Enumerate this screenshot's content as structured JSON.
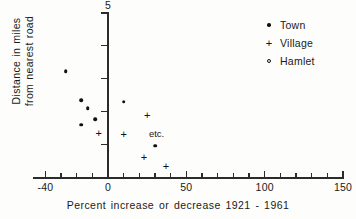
{
  "chart_data": {
    "type": "scatter",
    "title": "",
    "xlabel": "Percent increase or decrease 1921 - 1961",
    "ylabel_lines": [
      "Distance in miles",
      "from nearest road"
    ],
    "xlim": [
      -40,
      150
    ],
    "ylim": [
      0,
      5
    ],
    "xticks": [
      -40,
      0,
      50,
      100,
      150
    ],
    "xticklabels": [
      "-40",
      "0",
      "50",
      "100",
      "150"
    ],
    "x_minor_tick_step": 10,
    "yticks": [
      0,
      1,
      2,
      3,
      4,
      5
    ],
    "yticklabels_visible": [
      "5"
    ],
    "grid": false,
    "legend_position": "upper right",
    "series": [
      {
        "name": "Town",
        "marker": "filled-circle",
        "color": "#111111",
        "points": [
          {
            "x": -27,
            "y": 3.22
          },
          {
            "x": -17,
            "y": 2.35
          },
          {
            "x": -13,
            "y": 2.1
          },
          {
            "x": -17,
            "y": 1.59
          },
          {
            "x": -8,
            "y": 1.77
          },
          {
            "x": 10,
            "y": 2.29
          },
          {
            "x": 30,
            "y": 0.95
          }
        ]
      },
      {
        "name": "Village",
        "marker": "plus",
        "color": "#111111",
        "points": [
          {
            "x": -6,
            "y": 1.34
          },
          {
            "x": 10,
            "y": 1.31
          },
          {
            "x": 25,
            "y": 1.89
          },
          {
            "x": 23,
            "y": 0.61
          },
          {
            "x": 37,
            "y": 0.34
          }
        ]
      },
      {
        "name": "Hamlet",
        "marker": "open-circle",
        "color": "#111111",
        "points": []
      }
    ],
    "annotations": [
      {
        "text": "etc.",
        "x": 31,
        "y": 1.33
      }
    ]
  },
  "legend": {
    "entries": [
      {
        "label": "Town",
        "glyph": "filled-circle-icon"
      },
      {
        "label": "Village",
        "glyph": "plus-icon"
      },
      {
        "label": "Hamlet",
        "glyph": "open-circle-icon"
      }
    ]
  },
  "axes": {
    "y_top_label": "5"
  }
}
